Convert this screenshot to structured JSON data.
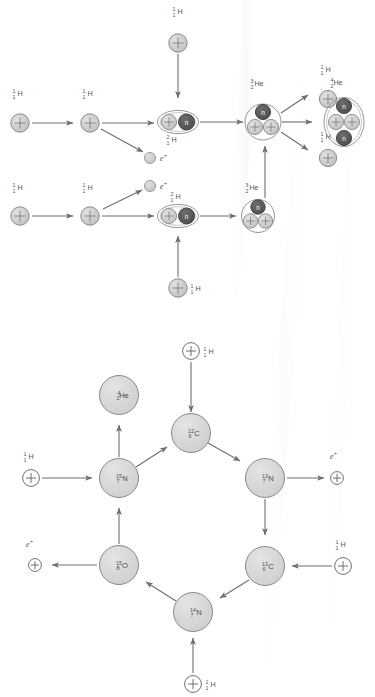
{
  "figure": {
    "colors": {
      "proton_fill": "#c9c9c9",
      "proton_stroke": "#8c8c8c",
      "neutron_fill": "#5a5a5a",
      "neutron_stroke": "#3f3f3f",
      "nucleus_outline": "#8a8a8a",
      "node_fill": "#d9d9d9",
      "node_stroke": "#8a8a8a",
      "arrow": "#6e6e6e",
      "text": "#4a4a4a",
      "background": "#ffffff"
    },
    "glyphs": {
      "proton": "+",
      "neutron": "n",
      "positron": "e+"
    }
  },
  "pp_chain": {
    "name": "proton-proton chain",
    "labels": {
      "hydrogen_mass": "1",
      "hydrogen_charge": "1",
      "hydrogen_symbol": "H",
      "deuterium_mass": "2",
      "deuterium_charge": "1",
      "deuterium_symbol": "H",
      "helium3_mass": "3",
      "helium3_charge": "2",
      "helium3_symbol": "He",
      "helium4_mass": "4",
      "helium4_charge": "2",
      "helium4_symbol": "He",
      "positron": "e",
      "positron_sup": "+"
    },
    "nodes": [
      {
        "id": "h-top-left-1",
        "type": "proton",
        "label": "1/1 H"
      },
      {
        "id": "h-top-left-2",
        "type": "proton",
        "label": "1/1 H"
      },
      {
        "id": "h-top-feed",
        "type": "proton",
        "label": "1/1 H"
      },
      {
        "id": "d-top",
        "type": "deuterium",
        "label": "2/1 H"
      },
      {
        "id": "he3-top",
        "type": "helium3",
        "label": "3/2 He"
      },
      {
        "id": "pos-top",
        "type": "positron",
        "label": "e+"
      },
      {
        "id": "h-bot-left-1",
        "type": "proton",
        "label": "1/1 H"
      },
      {
        "id": "h-bot-left-2",
        "type": "proton",
        "label": "1/1 H"
      },
      {
        "id": "h-bot-feed",
        "type": "proton",
        "label": "1/1 H"
      },
      {
        "id": "d-bot",
        "type": "deuterium",
        "label": "2/1 H"
      },
      {
        "id": "he3-bot",
        "type": "helium3",
        "label": "3/2 He"
      },
      {
        "id": "pos-bot",
        "type": "positron",
        "label": "e+"
      },
      {
        "id": "h-out-upper",
        "type": "proton",
        "label": "1/1 H"
      },
      {
        "id": "h-out-lower",
        "type": "proton",
        "label": "1/1 H"
      },
      {
        "id": "he4-out",
        "type": "helium4",
        "label": "4/2 He"
      }
    ]
  },
  "cno_cycle": {
    "name": "CNO cycle",
    "nodes": [
      {
        "id": "c12",
        "mass": "12",
        "charge": "6",
        "symbol": "C"
      },
      {
        "id": "n13",
        "mass": "13",
        "charge": "7",
        "symbol": "N"
      },
      {
        "id": "c13",
        "mass": "13",
        "charge": "6",
        "symbol": "C"
      },
      {
        "id": "n14",
        "mass": "14",
        "charge": "7",
        "symbol": "N"
      },
      {
        "id": "o15",
        "mass": "15",
        "charge": "8",
        "symbol": "O"
      },
      {
        "id": "n15",
        "mass": "15",
        "charge": "7",
        "symbol": "N"
      },
      {
        "id": "he4",
        "mass": "4",
        "charge": "2",
        "symbol": "He"
      }
    ],
    "inputs": [
      {
        "id": "h-in-top",
        "mass": "1",
        "charge": "1",
        "symbol": "H"
      },
      {
        "id": "h-in-right",
        "mass": "1",
        "charge": "1",
        "symbol": "H"
      },
      {
        "id": "h-in-bottom",
        "mass": "1",
        "charge": "1",
        "symbol": "H"
      },
      {
        "id": "h-in-left",
        "mass": "1",
        "charge": "1",
        "symbol": "H"
      }
    ],
    "outputs": [
      {
        "id": "pos-right",
        "label": "e",
        "sup": "+"
      },
      {
        "id": "pos-left",
        "label": "e",
        "sup": "+"
      }
    ]
  }
}
